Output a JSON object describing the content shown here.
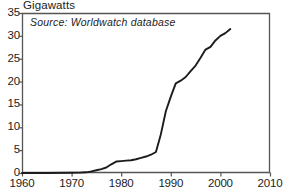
{
  "chart_data": {
    "type": "line",
    "title": "",
    "ylabel": "Gigawatts",
    "xlabel": "",
    "annotation": "Source: Worldwatch database",
    "xlim": [
      1960,
      2010
    ],
    "ylim": [
      0,
      35
    ],
    "xticks": [
      1960,
      1970,
      1980,
      1990,
      2000,
      2010
    ],
    "xtick_labels": [
      "1960",
      "1970",
      "1980",
      "1990",
      "2000",
      "2010"
    ],
    "yticks": [
      0,
      5,
      10,
      15,
      20,
      25,
      30,
      35
    ],
    "ytick_labels": [
      "0",
      "5",
      "10",
      "15",
      "20",
      "25",
      "30",
      "35"
    ],
    "grid": false,
    "legend": false,
    "line_color": "#1c1c1c",
    "line_width": 1.9,
    "series": [
      {
        "name": "World cumulative wind capacity",
        "x": [
          1960,
          1965,
          1970,
          1972,
          1973,
          1974,
          1975,
          1976,
          1977,
          1978,
          1979,
          1980,
          1981,
          1982,
          1983,
          1984,
          1985,
          1986,
          1987,
          1988,
          1989,
          1990,
          1991,
          1992,
          1993,
          1994,
          1995,
          1996,
          1997,
          1998,
          1999,
          2000,
          2001,
          2002
        ],
        "values": [
          0.0,
          0.0,
          0.05,
          0.1,
          0.15,
          0.35,
          0.6,
          0.85,
          1.2,
          1.9,
          2.5,
          2.6,
          2.7,
          2.8,
          3.0,
          3.3,
          3.6,
          4.0,
          4.6,
          8.5,
          13.5,
          16.7,
          19.6,
          20.2,
          21.0,
          22.3,
          23.5,
          25.2,
          27.0,
          27.6,
          29.0,
          30.0,
          30.6,
          31.5
        ]
      }
    ]
  },
  "frame": {
    "left_px": 22,
    "right_px": 270,
    "top_px": 13,
    "bottom_px": 173,
    "border_color": "#555555"
  }
}
